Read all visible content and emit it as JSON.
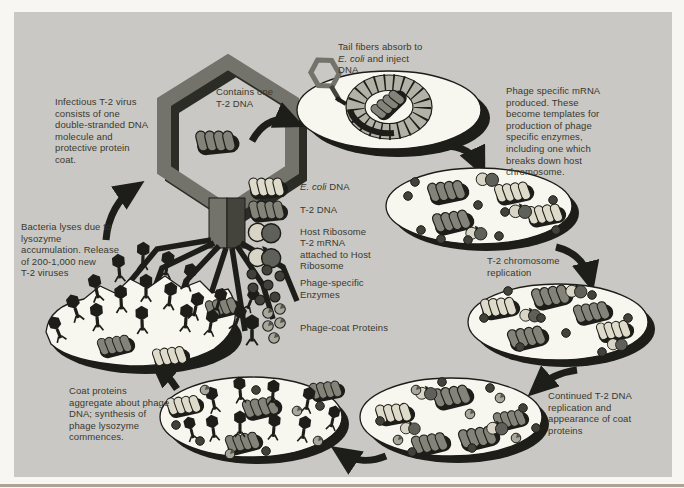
{
  "labels": {
    "virus_description": "Infectious T-2 virus\nconsists of one\ndouble-stranded DNA\nmolecule and\nprotective protein\ncoat.",
    "contains_dna": "Contains one\nT-2 DNA",
    "adsorption_line1": "Tail fibers absorb to",
    "adsorption_italic": "E. coli",
    "adsorption_line2_rest": " and inject",
    "adsorption_line3": "DNA.",
    "mrna_production": "Phage specific mRNA\nproduced. These\nbecome templates for\nproduction of phage\nspecific enzymes,\nincluding one which\nbreaks down host\nchromosome.",
    "chromosome_replication": "T-2 chromosome\nreplication",
    "continued_replication": "Continued T-2 DNA\nreplication and\nappearance of coat\nproteins",
    "coat_assembly": "Coat proteins\naggregate about phage\nDNA; synthesis of\nphage lysozyme\ncommences.",
    "lysis": "Bacteria lyses due to\nlysozyme\naccumulation. Release\nof 200-1,000 new\nT-2 viruses"
  },
  "legend": {
    "ecoli_dna_italic": "E. coli",
    "ecoli_dna_rest": " DNA",
    "t2_dna": "T-2 DNA",
    "host_ribosome": "Host Ribosome",
    "t2_mrna": "T-2 mRNA\nattached to Host\nRibosome",
    "enzymes": "Phage-specific\nEnzymes",
    "coat_proteins": "Phage-coat Proteins"
  },
  "colors": {
    "panel_bg": "#c9c8c4",
    "page_bg": "#f7f6f2",
    "ink": "#1d1d19",
    "text": "#39382e",
    "cell_fill": "#f7f6ef",
    "t2_dna": "#83837a",
    "ecoli_dna": "#dedbcb",
    "ribosome_light": "#d8d5c6",
    "ribosome_dark": "#60605a",
    "enzyme": "#42423b",
    "coat_protein": "#a7a79c",
    "virus_outline": "#73736b",
    "virus_shadow": "#2c2c27",
    "chromosome_ring": "#b3b2a7"
  }
}
